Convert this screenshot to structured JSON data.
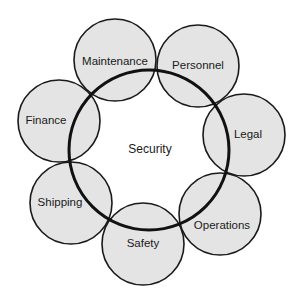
{
  "diagram": {
    "type": "hub-and-ring",
    "hub": {
      "label": "Security"
    },
    "nodes": [
      {
        "id": "maintenance",
        "label": "Maintenance"
      },
      {
        "id": "personnel",
        "label": "Personnel"
      },
      {
        "id": "legal",
        "label": "Legal"
      },
      {
        "id": "operations",
        "label": "Operations"
      },
      {
        "id": "safety",
        "label": "Safety"
      },
      {
        "id": "shipping",
        "label": "Shipping"
      },
      {
        "id": "finance",
        "label": "Finance"
      }
    ],
    "colors": {
      "node_fill": "#e4e4e4",
      "stroke": "#1a1a1a",
      "background": "#ffffff"
    }
  }
}
